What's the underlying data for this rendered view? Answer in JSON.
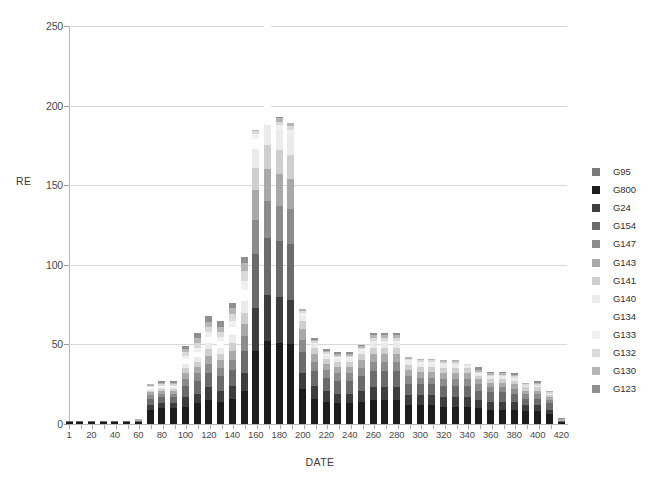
{
  "chart_data": {
    "type": "bar",
    "subtype": "stacked-bar",
    "title": "",
    "xlabel": "DATE",
    "ylabel": "RE",
    "ylim": [
      0,
      250
    ],
    "yticks": [
      0,
      50,
      100,
      150,
      200,
      250
    ],
    "xlim": [
      1,
      425
    ],
    "xticks": [
      1,
      20,
      40,
      60,
      80,
      100,
      120,
      140,
      160,
      180,
      200,
      220,
      240,
      260,
      280,
      300,
      320,
      340,
      360,
      380,
      400,
      420
    ],
    "xticklabels": [
      "1",
      "20",
      "40",
      "60",
      "80",
      "100",
      "120",
      "140",
      "160",
      "180",
      "200",
      "220",
      "240",
      "260",
      "280",
      "300",
      "320",
      "340",
      "360",
      "380",
      "400",
      "420"
    ],
    "grid": "horizontal",
    "legend_position": "right",
    "x": [
      1,
      10,
      20,
      30,
      40,
      50,
      60,
      70,
      80,
      90,
      100,
      110,
      120,
      130,
      140,
      150,
      160,
      170,
      180,
      190,
      200,
      210,
      220,
      230,
      240,
      250,
      260,
      270,
      280,
      290,
      300,
      310,
      320,
      330,
      340,
      350,
      360,
      370,
      380,
      390,
      400,
      410,
      420
    ],
    "categories": [
      "1",
      "10",
      "20",
      "30",
      "40",
      "50",
      "60",
      "70",
      "80",
      "90",
      "100",
      "110",
      "120",
      "130",
      "140",
      "150",
      "160",
      "170",
      "180",
      "190",
      "200",
      "210",
      "220",
      "230",
      "240",
      "250",
      "260",
      "270",
      "280",
      "290",
      "300",
      "310",
      "320",
      "330",
      "340",
      "350",
      "360",
      "370",
      "380",
      "390",
      "400",
      "410",
      "420"
    ],
    "totals": [
      3,
      3,
      3,
      3,
      3,
      3,
      4,
      25,
      27,
      27,
      49,
      54,
      64,
      61,
      71,
      98,
      185,
      195,
      193,
      189,
      72,
      54,
      47,
      45,
      45,
      50,
      57,
      57,
      57,
      42,
      41,
      40,
      39,
      39,
      38,
      36,
      33,
      33,
      32,
      26,
      26,
      21,
      4
    ],
    "series": [
      {
        "name": "G95",
        "color": "#7a7a7a",
        "values": [
          0,
          0,
          0,
          0,
          0,
          0,
          0,
          0,
          0,
          0,
          0,
          0,
          0,
          0,
          0,
          0,
          0,
          0,
          0,
          0,
          0,
          0,
          0,
          0,
          0,
          0,
          0,
          0,
          0,
          0,
          0,
          0,
          0,
          0,
          0,
          0,
          0,
          0,
          0,
          0,
          0,
          0,
          0
        ]
      },
      {
        "name": "G800",
        "color": "#1c1c1c",
        "values": [
          1,
          1,
          1,
          1,
          1,
          1,
          1,
          9,
          10,
          10,
          11,
          13,
          15,
          14,
          16,
          21,
          46,
          52,
          51,
          50,
          22,
          16,
          14,
          13,
          13,
          14,
          15,
          15,
          15,
          12,
          12,
          12,
          11,
          11,
          11,
          10,
          9,
          9,
          9,
          8,
          8,
          6,
          1
        ]
      },
      {
        "name": "G24",
        "color": "#3d3d3d",
        "values": [
          0,
          0,
          0,
          0,
          0,
          0,
          0,
          3,
          3,
          3,
          6,
          6,
          8,
          7,
          8,
          11,
          27,
          29,
          29,
          28,
          10,
          8,
          7,
          6,
          6,
          7,
          8,
          8,
          8,
          6,
          6,
          6,
          6,
          6,
          6,
          5,
          5,
          5,
          5,
          4,
          4,
          3,
          0
        ]
      },
      {
        "name": "G154",
        "color": "#6b6b6b",
        "values": [
          1,
          1,
          1,
          1,
          1,
          1,
          1,
          4,
          4,
          4,
          7,
          8,
          9,
          9,
          10,
          14,
          34,
          36,
          35,
          35,
          13,
          9,
          8,
          8,
          8,
          9,
          10,
          10,
          10,
          7,
          7,
          7,
          7,
          7,
          7,
          6,
          6,
          6,
          5,
          4,
          4,
          4,
          1
        ]
      },
      {
        "name": "G147",
        "color": "#8c8c8c",
        "values": [
          0,
          0,
          0,
          0,
          0,
          0,
          0,
          2,
          2,
          2,
          4,
          5,
          6,
          5,
          6,
          9,
          21,
          23,
          22,
          22,
          8,
          6,
          5,
          5,
          5,
          5,
          6,
          6,
          6,
          5,
          4,
          4,
          4,
          4,
          4,
          4,
          3,
          3,
          3,
          3,
          3,
          2,
          0
        ]
      },
      {
        "name": "G143",
        "color": "#a9a9a9",
        "values": [
          0,
          0,
          0,
          0,
          0,
          0,
          0,
          2,
          2,
          2,
          4,
          4,
          5,
          5,
          6,
          8,
          19,
          20,
          20,
          19,
          7,
          5,
          4,
          4,
          4,
          5,
          5,
          5,
          5,
          4,
          4,
          4,
          4,
          4,
          4,
          3,
          3,
          3,
          3,
          2,
          2,
          2,
          0
        ]
      },
      {
        "name": "G141",
        "color": "#cfcfcf",
        "values": [
          0,
          0,
          0,
          0,
          0,
          0,
          0,
          1,
          1,
          1,
          3,
          3,
          4,
          4,
          5,
          7,
          14,
          15,
          15,
          15,
          5,
          4,
          3,
          3,
          3,
          4,
          4,
          4,
          4,
          3,
          3,
          3,
          3,
          3,
          3,
          2,
          2,
          2,
          2,
          2,
          2,
          1,
          0
        ]
      },
      {
        "name": "G140",
        "color": "#ebebeb",
        "values": [
          0,
          0,
          0,
          0,
          0,
          0,
          0,
          1,
          1,
          1,
          3,
          3,
          4,
          4,
          5,
          7,
          12,
          13,
          13,
          13,
          3,
          2,
          2,
          2,
          2,
          2,
          3,
          3,
          3,
          2,
          2,
          2,
          2,
          2,
          2,
          2,
          2,
          2,
          2,
          1,
          1,
          1,
          0
        ]
      },
      {
        "name": "G134",
        "color": "#ffffff",
        "values": [
          0,
          0,
          0,
          0,
          0,
          0,
          0,
          1,
          1,
          1,
          3,
          3,
          4,
          4,
          5,
          7,
          6,
          358,
          0,
          0,
          0,
          0,
          0,
          0,
          0,
          0,
          0,
          0,
          0,
          0,
          0,
          0,
          0,
          0,
          0,
          0,
          0,
          0,
          0,
          0,
          0,
          0,
          0
        ]
      },
      {
        "name": "G133",
        "color": "#f0f0f0",
        "values": [
          0,
          0,
          0,
          0,
          0,
          0,
          0,
          0,
          0,
          0,
          2,
          3,
          3,
          3,
          4,
          6,
          3,
          2,
          3,
          3,
          2,
          1,
          1,
          1,
          1,
          1,
          1,
          1,
          1,
          1,
          1,
          1,
          1,
          1,
          0,
          0,
          0,
          0,
          0,
          0,
          0,
          0,
          0
        ]
      },
      {
        "name": "G132",
        "color": "#dadada",
        "values": [
          0,
          0,
          0,
          0,
          0,
          0,
          0,
          1,
          1,
          1,
          2,
          3,
          3,
          3,
          4,
          6,
          2,
          2,
          2,
          2,
          1,
          1,
          1,
          1,
          1,
          1,
          2,
          2,
          2,
          1,
          1,
          1,
          1,
          1,
          1,
          1,
          1,
          1,
          1,
          1,
          1,
          1,
          0
        ]
      },
      {
        "name": "G130",
        "color": "#b5b5b5",
        "values": [
          0,
          0,
          0,
          0,
          0,
          0,
          1,
          1,
          1,
          1,
          2,
          3,
          3,
          3,
          4,
          5,
          1,
          2,
          2,
          2,
          1,
          1,
          1,
          1,
          1,
          1,
          2,
          2,
          2,
          1,
          1,
          1,
          1,
          1,
          0,
          1,
          1,
          1,
          1,
          1,
          1,
          1,
          1
        ]
      },
      {
        "name": "G123",
        "color": "#8f8f8f",
        "values": [
          0,
          0,
          0,
          0,
          0,
          0,
          0,
          0,
          1,
          1,
          2,
          3,
          4,
          4,
          3,
          4,
          0,
          1,
          1,
          0,
          0,
          1,
          1,
          1,
          1,
          1,
          1,
          1,
          1,
          0,
          0,
          0,
          0,
          0,
          0,
          2,
          1,
          1,
          1,
          0,
          1,
          0,
          1
        ]
      }
    ]
  },
  "axes": {
    "y_title": "RE",
    "x_title": "DATE",
    "y_tick_labels": [
      "0",
      "50",
      "100",
      "150",
      "200",
      "250"
    ],
    "x_tick_labels": [
      "1",
      "20",
      "40",
      "60",
      "80",
      "100",
      "120",
      "140",
      "160",
      "180",
      "200",
      "220",
      "240",
      "260",
      "280",
      "300",
      "320",
      "340",
      "360",
      "380",
      "400",
      "420"
    ]
  },
  "legend": {
    "items": [
      {
        "label": "G95",
        "color": "#7a7a7a"
      },
      {
        "label": "G800",
        "color": "#1c1c1c"
      },
      {
        "label": "G24",
        "color": "#3d3d3d"
      },
      {
        "label": "G154",
        "color": "#6b6b6b"
      },
      {
        "label": "G147",
        "color": "#8c8c8c"
      },
      {
        "label": "G143",
        "color": "#a9a9a9"
      },
      {
        "label": "G141",
        "color": "#cfcfcf"
      },
      {
        "label": "G140",
        "color": "#ebebeb"
      },
      {
        "label": "G134",
        "color": "#ffffff"
      },
      {
        "label": "G133",
        "color": "#f0f0f0"
      },
      {
        "label": "G132",
        "color": "#dadada"
      },
      {
        "label": "G130",
        "color": "#b5b5b5"
      },
      {
        "label": "G123",
        "color": "#8f8f8f"
      }
    ]
  },
  "colors": {
    "background": "#ffffff",
    "gridline": "#d8d8d8",
    "axis": "#b8b8b8",
    "text": "#404040"
  }
}
